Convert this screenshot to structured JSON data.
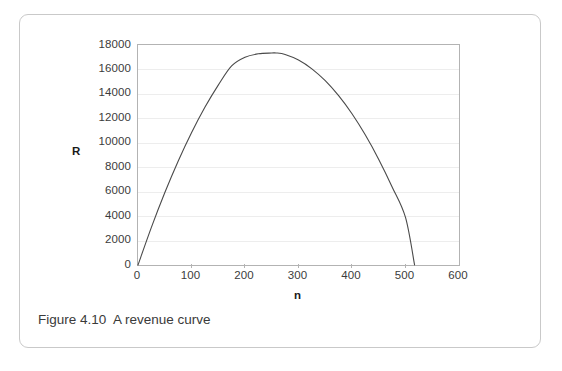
{
  "figure": {
    "caption_number": "Figure 4.10",
    "caption_text": "A revenue curve",
    "caption_full": "Figure 4.10  A revenue curve",
    "frame_color": "#c9c9c9"
  },
  "chart_data": {
    "type": "line",
    "title": "",
    "subtitle": "",
    "xlabel": "n",
    "ylabel": "R",
    "xlim": [
      0,
      600
    ],
    "ylim": [
      0,
      18000
    ],
    "xticks": [
      0,
      100,
      200,
      300,
      400,
      500,
      600
    ],
    "xtick_labels": [
      "0",
      "100",
      "200",
      "300",
      "400",
      "500",
      "600"
    ],
    "yticks": [
      0,
      2000,
      4000,
      6000,
      8000,
      10000,
      12000,
      14000,
      16000,
      18000
    ],
    "ytick_labels": [
      "0",
      "2000",
      "4000",
      "6000",
      "8000",
      "10000",
      "12000",
      "14000",
      "16000",
      "18000"
    ],
    "grid": "horizontal",
    "legend": "none",
    "curve_color": "#4a4a4a",
    "gridline_color": "#ededed",
    "axis_color": "#b3b3b3",
    "series": [
      {
        "name": "R",
        "description": "downward parabola through origin, peak R=17350 at n=258, returns to zero at n=517",
        "x": [
          0,
          25,
          50,
          75,
          100,
          125,
          150,
          175,
          200,
          225,
          250,
          258,
          275,
          300,
          325,
          350,
          375,
          400,
          425,
          450,
          475,
          500,
          517
        ],
        "y": [
          0,
          3080,
          5910,
          8490,
          10820,
          12900,
          14720,
          16290,
          17000,
          17280,
          17340,
          17350,
          17230,
          16770,
          16050,
          15080,
          13850,
          12370,
          10630,
          8640,
          6390,
          3890,
          0
        ]
      }
    ],
    "peak": {
      "n": 258,
      "R": 17350
    },
    "zero_crossings": [
      0,
      517
    ]
  }
}
